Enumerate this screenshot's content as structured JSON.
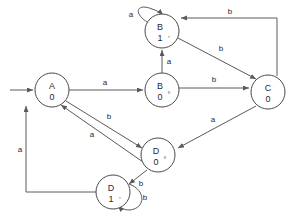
{
  "diagram": {
    "type": "finite-state-machine",
    "title": "",
    "nodes": [
      {
        "id": "A",
        "label": "A",
        "prime": "",
        "output": "0",
        "cx": 52,
        "cy": 90,
        "r": 17
      },
      {
        "id": "B1",
        "label": "B",
        "prime": "'",
        "output": "1",
        "cx": 162,
        "cy": 31,
        "r": 17
      },
      {
        "id": "B0",
        "label": "B",
        "prime": "°",
        "output": "0",
        "cx": 162,
        "cy": 90,
        "r": 17
      },
      {
        "id": "C",
        "label": "C",
        "prime": "",
        "output": "0",
        "cx": 268,
        "cy": 92,
        "r": 17
      },
      {
        "id": "D0",
        "label": "D",
        "prime": "°",
        "output": "0",
        "cx": 158,
        "cy": 155,
        "r": 17
      },
      {
        "id": "D1",
        "label": "D",
        "prime": "'",
        "output": "1",
        "cx": 113,
        "cy": 192,
        "r": 17
      }
    ],
    "edges": [
      {
        "from": "start",
        "to": "A",
        "label": "",
        "kind": "initial"
      },
      {
        "from": "A",
        "to": "B0",
        "label": "a",
        "kind": "straight"
      },
      {
        "from": "B0",
        "to": "B1",
        "label": "a",
        "kind": "straight"
      },
      {
        "from": "B0",
        "to": "C",
        "label": "b",
        "kind": "straight"
      },
      {
        "from": "B1",
        "to": "B1",
        "label": "a",
        "kind": "self-loop"
      },
      {
        "from": "B1",
        "to": "C",
        "label": "b",
        "kind": "diagonal"
      },
      {
        "from": "C",
        "to": "B1",
        "label": "b",
        "kind": "routed-top"
      },
      {
        "from": "C",
        "to": "D0",
        "label": "a",
        "kind": "diagonal"
      },
      {
        "from": "A",
        "to": "D0",
        "label": "b",
        "kind": "diagonal"
      },
      {
        "from": "D0",
        "to": "A",
        "label": "a",
        "kind": "diagonal"
      },
      {
        "from": "D0",
        "to": "D1",
        "label": "b",
        "kind": "straight"
      },
      {
        "from": "D1",
        "to": "D1",
        "label": "b",
        "kind": "self-loop"
      },
      {
        "from": "D1",
        "to": "A",
        "label": "a",
        "kind": "routed-left"
      }
    ],
    "edge_labels": {
      "a_self_b1": "a",
      "b_top_c_to_b1": "b",
      "b_b1_to_c": "b",
      "a_b0_to_b1": "a",
      "a_a_to_b0": "a",
      "b_b0_to_c": "b",
      "b_a_to_d0": "b",
      "a_d0_to_a": "a",
      "a_c_to_d0": "a",
      "a_d1_to_a": "a",
      "b_d0_to_d1": "b",
      "b_self_d1": "b"
    },
    "colors": {
      "stroke": "#5a5a5a",
      "node_stroke": "#4a4a4a",
      "text": "#2a2a2a",
      "background": "#ffffff"
    }
  }
}
